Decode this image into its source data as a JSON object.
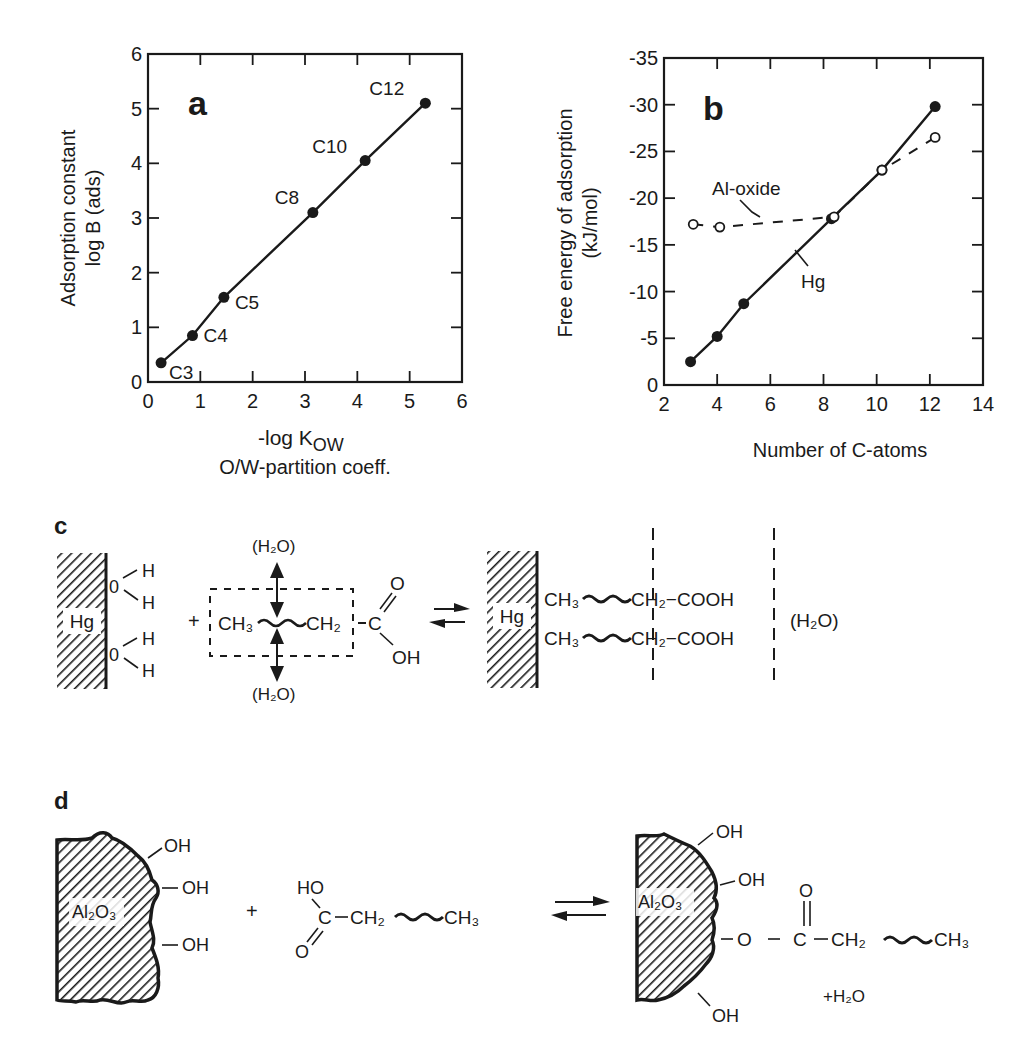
{
  "chart_data": [
    {
      "id": "a",
      "type": "line",
      "panel_label": "a",
      "title": "",
      "xlabel": "-log K_OW",
      "xlabel_main": "-log K",
      "xlabel_sub": "OW",
      "xlabel_line2": "O/W-partition coeff.",
      "ylabel_line1": "Adsorption constant",
      "ylabel_line2": "log B  (ads)",
      "xlim": [
        0,
        6
      ],
      "ylim": [
        0,
        6
      ],
      "xticks": [
        "0",
        "1",
        "2",
        "3",
        "4",
        "5",
        "6"
      ],
      "yticks": [
        "0",
        "1",
        "2",
        "3",
        "4",
        "5",
        "6"
      ],
      "grid": false,
      "series": [
        {
          "name": "fatty acids",
          "marker": "filled-circle",
          "line": "solid",
          "points": [
            {
              "label": "C3",
              "x": 0.25,
              "y": 0.35
            },
            {
              "label": "C4",
              "x": 0.85,
              "y": 0.85
            },
            {
              "label": "C5",
              "x": 1.45,
              "y": 1.55
            },
            {
              "label": "C8",
              "x": 3.15,
              "y": 3.1
            },
            {
              "label": "C10",
              "x": 4.15,
              "y": 4.05
            },
            {
              "label": "C12",
              "x": 5.3,
              "y": 5.1
            }
          ]
        }
      ]
    },
    {
      "id": "b",
      "type": "line",
      "panel_label": "b",
      "title": "",
      "xlabel": "Number of C-atoms",
      "ylabel_line1": "Free energy of adsorption",
      "ylabel_line2": "(kJ/mol)",
      "xlim": [
        2,
        14
      ],
      "ylim": [
        0,
        -35
      ],
      "xticks": [
        "2",
        "4",
        "6",
        "8",
        "10",
        "12",
        "14"
      ],
      "yticks": [
        "0",
        "-5",
        "-10",
        "-15",
        "-20",
        "-25",
        "-30",
        "-35"
      ],
      "grid": false,
      "series": [
        {
          "name": "Hg",
          "marker": "filled-circle",
          "line": "solid",
          "points": [
            {
              "x": 3,
              "y": -2.5
            },
            {
              "x": 4,
              "y": -5.2
            },
            {
              "x": 5,
              "y": -8.7
            },
            {
              "x": 8.3,
              "y": -17.8
            },
            {
              "x": 10.2,
              "y": -23
            },
            {
              "x": 12.2,
              "y": -29.8
            }
          ]
        },
        {
          "name": "Al-oxide",
          "marker": "open-circle",
          "line": "dashed",
          "points": [
            {
              "x": 3.1,
              "y": -17.2
            },
            {
              "x": 4.1,
              "y": -16.9
            },
            {
              "x": 8.4,
              "y": -18
            },
            {
              "x": 10.2,
              "y": -23
            },
            {
              "x": 12.2,
              "y": -26.5
            }
          ]
        }
      ],
      "annotations": [
        "Al-oxide",
        "Hg"
      ]
    }
  ],
  "diagram_c": {
    "panel_label": "c",
    "surface": "Hg",
    "water_O": "0",
    "water_H": "H",
    "plus": "+",
    "h2o_top": "(H₂O)",
    "h2o_bottom": "(H₂O)",
    "ch3": "CH₃",
    "ch2": "CH₂",
    "carbon": "C",
    "carbonyl_O": "O",
    "hydroxyl": "OH",
    "product_chain": "CH₂−COOH",
    "product_ch3": "CH₃",
    "h2o_right": "(H₂O)"
  },
  "diagram_d": {
    "panel_label": "d",
    "surface": "Al₂O₃",
    "oh": "OH",
    "plus": "+",
    "ho": "HO",
    "carbon": "C",
    "ch2": "CH₂",
    "ch3": "CH₃",
    "o": "O",
    "ester_o": "O",
    "plus_water": "+H₂O"
  },
  "colors": {
    "ink": "#1a1a1a",
    "background": "#ffffff"
  }
}
